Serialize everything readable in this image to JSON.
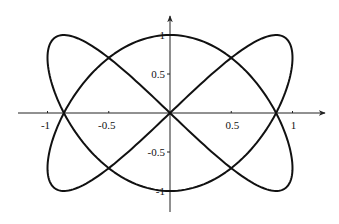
{
  "chart_data": {
    "type": "line",
    "title": "",
    "xlabel": "",
    "ylabel": "",
    "curve": {
      "kind": "parametric",
      "x_expr": "sin(2t)",
      "y_expr": "cos(3t)",
      "t_range": [
        0,
        6.283185307
      ],
      "samples": 400,
      "key_points": [
        {
          "x": 0,
          "y": 1
        },
        {
          "x": 0.866,
          "y": 0
        },
        {
          "x": 0.866,
          "y": -1
        },
        {
          "x": 0,
          "y": 0
        },
        {
          "x": -0.866,
          "y": 1
        },
        {
          "x": -0.866,
          "y": 0
        },
        {
          "x": 0,
          "y": -1
        },
        {
          "x": 0.866,
          "y": 1
        },
        {
          "x": -0.866,
          "y": -1
        },
        {
          "x": 1,
          "y": -0.707
        },
        {
          "x": -1,
          "y": 0.707
        },
        {
          "x": 1,
          "y": 0.707
        },
        {
          "x": -1,
          "y": -0.707
        }
      ]
    },
    "xlim": [
      -1.3,
      1.3
    ],
    "ylim": [
      -1.25,
      1.25
    ],
    "x_ticks": [
      {
        "value": -1,
        "label": "-1"
      },
      {
        "value": -0.5,
        "label": "-0.5"
      },
      {
        "value": 0.5,
        "label": "0.5"
      },
      {
        "value": 1,
        "label": "1"
      }
    ],
    "y_ticks": [
      {
        "value": 1,
        "label": "1"
      },
      {
        "value": 0.5,
        "label": "0.5"
      },
      {
        "value": -0.5,
        "label": "-0.5"
      },
      {
        "value": -1,
        "label": "-1"
      }
    ],
    "grid": false,
    "legend": null,
    "colors": {
      "curve": "#111111",
      "axes": "#222222"
    }
  },
  "layout": {
    "origin_px": [
      170,
      113
    ],
    "x_scale_px": 122.5,
    "y_scale_px": 78
  }
}
